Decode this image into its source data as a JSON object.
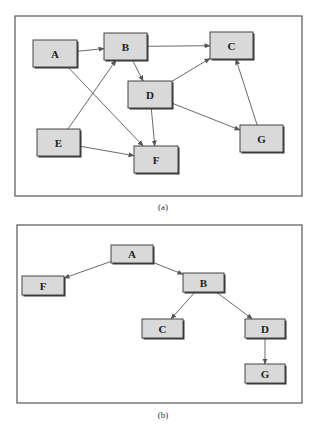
{
  "figure_a": {
    "caption": "(a)",
    "frame": {
      "x": 15,
      "y": 16,
      "w": 287,
      "h": 180
    },
    "nodes": [
      {
        "id": "A",
        "label": "A",
        "x": 33,
        "y": 40,
        "w": 44,
        "h": 27
      },
      {
        "id": "B",
        "label": "B",
        "x": 104,
        "y": 33,
        "w": 43,
        "h": 27
      },
      {
        "id": "C",
        "label": "C",
        "x": 210,
        "y": 32,
        "w": 43,
        "h": 27
      },
      {
        "id": "D",
        "label": "D",
        "x": 128,
        "y": 81,
        "w": 44,
        "h": 27
      },
      {
        "id": "E",
        "label": "E",
        "x": 37,
        "y": 129,
        "w": 43,
        "h": 27
      },
      {
        "id": "F",
        "label": "F",
        "x": 134,
        "y": 146,
        "w": 44,
        "h": 27
      },
      {
        "id": "G",
        "label": "G",
        "x": 240,
        "y": 125,
        "w": 43,
        "h": 27
      }
    ],
    "edges": [
      {
        "from": "A",
        "to": "B"
      },
      {
        "from": "B",
        "to": "C"
      },
      {
        "from": "B",
        "to": "D"
      },
      {
        "from": "A",
        "to": "F"
      },
      {
        "from": "E",
        "to": "B"
      },
      {
        "from": "E",
        "to": "F"
      },
      {
        "from": "D",
        "to": "F"
      },
      {
        "from": "D",
        "to": "C"
      },
      {
        "from": "D",
        "to": "G"
      },
      {
        "from": "G",
        "to": "C"
      }
    ]
  },
  "figure_b": {
    "caption": "(b)",
    "frame": {
      "x": 17,
      "y": 225,
      "w": 285,
      "h": 178
    },
    "nodes": [
      {
        "id": "A",
        "label": "A",
        "x": 111,
        "y": 245,
        "w": 42,
        "h": 18
      },
      {
        "id": "F",
        "label": "F",
        "x": 22,
        "y": 276,
        "w": 42,
        "h": 19
      },
      {
        "id": "B",
        "label": "B",
        "x": 183,
        "y": 273,
        "w": 41,
        "h": 19
      },
      {
        "id": "C",
        "label": "C",
        "x": 142,
        "y": 319,
        "w": 41,
        "h": 19
      },
      {
        "id": "D",
        "label": "D",
        "x": 245,
        "y": 319,
        "w": 40,
        "h": 19
      },
      {
        "id": "G",
        "label": "G",
        "x": 245,
        "y": 364,
        "w": 40,
        "h": 19
      }
    ],
    "edges": [
      {
        "from": "A",
        "to": "F"
      },
      {
        "from": "A",
        "to": "B"
      },
      {
        "from": "B",
        "to": "C"
      },
      {
        "from": "B",
        "to": "D"
      },
      {
        "from": "D",
        "to": "G"
      }
    ]
  },
  "colors": {
    "node_fill": "#d9d9d9",
    "node_stroke": "#444444",
    "edge": "#6a6a6a",
    "frame": "#555555"
  }
}
